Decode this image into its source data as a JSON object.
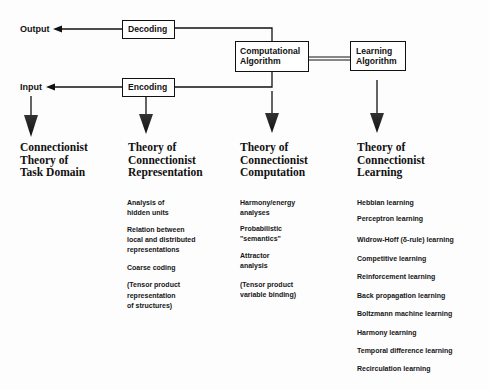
{
  "flow": {
    "output_label": "Output",
    "input_label": "Input",
    "decoding_box": "Decoding",
    "encoding_box": "Encoding",
    "computational_box": "Computational\nAlgorithm",
    "learning_box": "Learning\nAlgorithm"
  },
  "columns": [
    {
      "heading": "Connectionist\nTheory of\nTask Domain",
      "items": []
    },
    {
      "heading": "Theory of\nConnectionist\nRepresentation",
      "items": [
        "Analysis of\nhidden units",
        "Relation between\nlocal and distributed\nrepresentations",
        "Coarse coding",
        "(Tensor product\nrepresentation\nof structures)"
      ]
    },
    {
      "heading": "Theory of\nConnectionist\nComputation",
      "items": [
        "Harmony/energy\nanalyses",
        "Probabilistic\n\"semantics\"",
        "Attractor\nanalysis",
        "(Tensor product\nvariable binding)"
      ]
    },
    {
      "heading": "Theory of\nConnectionist\nLearning",
      "items": [
        "Hebbian learning",
        "Perceptron learning",
        "Widrow-Hoff (δ-rule) learning",
        "Competitive learning",
        "Reinforcement learning",
        "Back propagation learning",
        "Boltzmann machine learning",
        "Harmony learning",
        "Temporal difference learning",
        "Recirculation learning"
      ]
    }
  ],
  "colors": {
    "ink": "#111111",
    "background": "#fdfdfd"
  }
}
